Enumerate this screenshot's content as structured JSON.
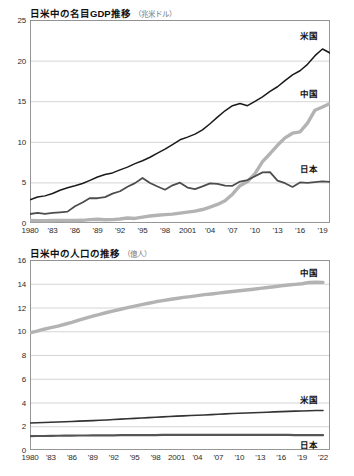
{
  "chart_data": [
    {
      "id": "gdp",
      "type": "line",
      "title": "日米中の名目GDP推移",
      "unit_label": "（兆米ドル）",
      "xlabel": "",
      "ylabel": "",
      "ylim": [
        0,
        25
      ],
      "yticks": [
        0,
        5,
        10,
        15,
        20,
        25
      ],
      "xlim": [
        1980,
        2020
      ],
      "xticks": [
        1980,
        1983,
        1986,
        1989,
        1992,
        1995,
        1998,
        2001,
        2004,
        2007,
        2010,
        2013,
        2016,
        2019
      ],
      "xticklabels": [
        "1980",
        "'83",
        "'86",
        "'89",
        "'92",
        "'95",
        "'98",
        "2001",
        "'04",
        "'07",
        "'10",
        "'13",
        "'16",
        "'19"
      ],
      "grid": true,
      "legend_position": "right-inline",
      "x": [
        1980,
        1981,
        1982,
        1983,
        1984,
        1985,
        1986,
        1987,
        1988,
        1989,
        1990,
        1991,
        1992,
        1993,
        1994,
        1995,
        1996,
        1997,
        1998,
        1999,
        2000,
        2001,
        2002,
        2003,
        2004,
        2005,
        2006,
        2007,
        2008,
        2009,
        2010,
        2011,
        2012,
        2013,
        2014,
        2015,
        2016,
        2017,
        2018,
        2019,
        2020
      ],
      "series": [
        {
          "name": "米国",
          "color": "#1a1a1a",
          "width": 1.5,
          "label_value": 21.4,
          "values": [
            2.86,
            3.21,
            3.34,
            3.63,
            4.04,
            4.34,
            4.58,
            4.86,
            5.25,
            5.66,
            5.98,
            6.17,
            6.54,
            6.88,
            7.31,
            7.66,
            8.1,
            8.61,
            9.09,
            9.66,
            10.25,
            10.58,
            10.94,
            11.46,
            12.22,
            13.04,
            13.82,
            14.45,
            14.71,
            14.45,
            14.99,
            15.54,
            16.2,
            16.78,
            17.53,
            18.24,
            18.75,
            19.54,
            20.61,
            21.43,
            20.94
          ]
        },
        {
          "name": "中国",
          "color": "#b3b3b3",
          "width": 3.4,
          "label_value": 14.3,
          "values": [
            0.31,
            0.29,
            0.28,
            0.31,
            0.32,
            0.31,
            0.3,
            0.33,
            0.41,
            0.46,
            0.4,
            0.41,
            0.49,
            0.62,
            0.56,
            0.73,
            0.86,
            0.96,
            1.03,
            1.09,
            1.21,
            1.34,
            1.47,
            1.66,
            1.96,
            2.29,
            2.75,
            3.55,
            4.59,
            5.11,
            6.09,
            7.55,
            8.53,
            9.57,
            10.48,
            11.06,
            11.23,
            12.31,
            13.89,
            14.28,
            14.72
          ]
        },
        {
          "name": "日本",
          "color": "#4d4d4d",
          "width": 1.8,
          "label_value": 5.1,
          "values": [
            1.11,
            1.24,
            1.13,
            1.24,
            1.32,
            1.4,
            2.07,
            2.53,
            3.07,
            3.05,
            3.19,
            3.62,
            3.91,
            4.46,
            4.91,
            5.55,
            4.92,
            4.49,
            4.1,
            4.64,
            4.97,
            4.37,
            4.18,
            4.52,
            4.89,
            4.83,
            4.6,
            4.58,
            5.11,
            5.29,
            5.76,
            6.23,
            6.27,
            5.21,
            4.9,
            4.44,
            5.0,
            4.93,
            5.04,
            5.12,
            5.06
          ]
        }
      ]
    },
    {
      "id": "pop",
      "type": "line",
      "title": "日米中の人口の推移",
      "unit_label": "（億人）",
      "xlabel": "",
      "ylabel": "",
      "ylim": [
        0,
        16
      ],
      "yticks": [
        0,
        2,
        4,
        6,
        8,
        10,
        12,
        14,
        16
      ],
      "xlim": [
        1980,
        2023
      ],
      "xticks": [
        1980,
        1983,
        1986,
        1989,
        1992,
        1995,
        1998,
        2001,
        2004,
        2007,
        2010,
        2013,
        2016,
        2019,
        2022
      ],
      "xticklabels": [
        "1980",
        "'83",
        "'86",
        "'89",
        "'92",
        "'95",
        "'98",
        "2001",
        "'04",
        "'07",
        "'10",
        "'13",
        "'16",
        "'19",
        "'22"
      ],
      "grid": true,
      "legend_position": "right-inline",
      "x": [
        1980,
        1981,
        1982,
        1983,
        1984,
        1985,
        1986,
        1987,
        1988,
        1989,
        1990,
        1991,
        1992,
        1993,
        1994,
        1995,
        1996,
        1997,
        1998,
        1999,
        2000,
        2001,
        2002,
        2003,
        2004,
        2005,
        2006,
        2007,
        2008,
        2009,
        2010,
        2011,
        2012,
        2013,
        2014,
        2015,
        2016,
        2017,
        2018,
        2019,
        2020,
        2021,
        2022
      ],
      "series": [
        {
          "name": "中国",
          "color": "#b3b3b3",
          "width": 3.4,
          "label_value": 14.1,
          "values": [
            9.87,
            10.01,
            10.17,
            10.3,
            10.44,
            10.59,
            10.75,
            10.93,
            11.1,
            11.27,
            11.43,
            11.58,
            11.72,
            11.85,
            11.99,
            12.11,
            12.24,
            12.36,
            12.48,
            12.58,
            12.67,
            12.76,
            12.85,
            12.92,
            13.0,
            13.08,
            13.14,
            13.21,
            13.28,
            13.35,
            13.41,
            13.47,
            13.54,
            13.61,
            13.68,
            13.75,
            13.83,
            13.9,
            13.95,
            14.0,
            14.11,
            14.13,
            14.12
          ]
        },
        {
          "name": "米国",
          "color": "#333333",
          "width": 1.6,
          "label_value": 3.33,
          "values": [
            2.27,
            2.3,
            2.32,
            2.34,
            2.36,
            2.38,
            2.4,
            2.43,
            2.45,
            2.47,
            2.5,
            2.53,
            2.57,
            2.6,
            2.63,
            2.66,
            2.69,
            2.73,
            2.76,
            2.79,
            2.82,
            2.85,
            2.87,
            2.9,
            2.93,
            2.95,
            2.98,
            3.01,
            3.04,
            3.07,
            3.09,
            3.12,
            3.14,
            3.16,
            3.18,
            3.21,
            3.23,
            3.25,
            3.27,
            3.28,
            3.31,
            3.32,
            3.33
          ]
        },
        {
          "name": "日本",
          "color": "#555555",
          "width": 2.2,
          "label_value": 1.25,
          "values": [
            1.17,
            1.18,
            1.18,
            1.19,
            1.2,
            1.21,
            1.21,
            1.22,
            1.22,
            1.23,
            1.23,
            1.24,
            1.24,
            1.25,
            1.25,
            1.25,
            1.26,
            1.26,
            1.26,
            1.27,
            1.27,
            1.27,
            1.27,
            1.28,
            1.28,
            1.28,
            1.28,
            1.28,
            1.28,
            1.28,
            1.28,
            1.28,
            1.28,
            1.27,
            1.27,
            1.27,
            1.27,
            1.27,
            1.26,
            1.26,
            1.26,
            1.25,
            1.25
          ]
        }
      ]
    }
  ]
}
